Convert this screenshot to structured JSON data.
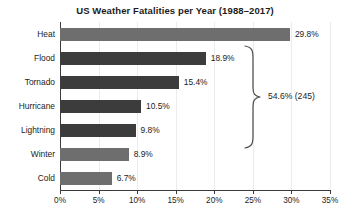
{
  "chart_data": {
    "type": "bar",
    "orientation": "horizontal",
    "title": "US Weather Fatalities per Year (1988–2017)",
    "xlabel": "",
    "ylabel": "",
    "xlim": [
      0,
      35
    ],
    "grid": true,
    "legend": "none",
    "categories": [
      "Heat",
      "Flood",
      "Tornado",
      "Hurricane",
      "Lightning",
      "Winter",
      "Cold"
    ],
    "values": [
      29.8,
      18.9,
      15.4,
      10.5,
      9.8,
      8.9,
      6.7
    ],
    "value_labels": [
      "29.8%",
      "18.9%",
      "15.4%",
      "10.5%",
      "9.8%",
      "8.9%",
      "6.7%"
    ],
    "bar_shades": [
      "light",
      "dark",
      "dark",
      "dark",
      "dark",
      "light",
      "light"
    ],
    "xticks": [
      0,
      5,
      10,
      15,
      20,
      25,
      30,
      35
    ],
    "xtick_labels": [
      "0%",
      "5%",
      "10%",
      "15%",
      "20%",
      "25%",
      "30%",
      "35%"
    ],
    "annotations": [
      {
        "type": "brace",
        "label": "54.6% (245)",
        "spans_categories": [
          "Flood",
          "Tornado",
          "Hurricane",
          "Lightning"
        ]
      }
    ],
    "colors": {
      "bar_light": "#6e6e6e",
      "bar_dark": "#3c3c3c",
      "axis": "#3a3a3a",
      "gridline": "#ececec",
      "text": "#1c1c1c",
      "background": "#ffffff"
    }
  }
}
